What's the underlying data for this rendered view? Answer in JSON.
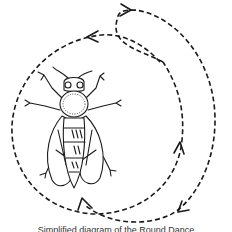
{
  "figure": {
    "caption": "Simplified diagram of the Round Dance",
    "colors": {
      "ink": "#1a1a1a",
      "background": "#ffffff"
    },
    "paths": [
      {
        "name": "inner-loop",
        "direction": "counter-clockwise",
        "style": "dashed"
      },
      {
        "name": "outer-loop",
        "direction": "clockwise",
        "style": "dashed"
      }
    ],
    "arrows": [
      {
        "name": "arrow-top-left",
        "points": "left"
      },
      {
        "name": "arrow-top-right",
        "points": "right"
      },
      {
        "name": "arrow-right-inner",
        "points": "up"
      },
      {
        "name": "arrow-bottom-right",
        "points": "down-left"
      },
      {
        "name": "arrow-bottom-tail",
        "points": "up"
      }
    ]
  }
}
